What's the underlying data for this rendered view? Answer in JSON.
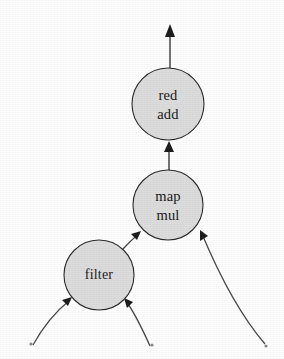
{
  "diagram": {
    "type": "dataflow-graph",
    "title": "",
    "background_color": "#fefefe",
    "node_fill_color": "#dcdcdc",
    "node_stroke_color": "#2b2b2b",
    "edge_color": "#3a3a3a",
    "nodes": [
      {
        "id": "red-add",
        "lines": [
          "red",
          "add"
        ],
        "line1": "red",
        "line2": "add",
        "cx": 168,
        "cy": 104,
        "r": 36
      },
      {
        "id": "map-mul",
        "lines": [
          "map",
          "mul"
        ],
        "line1": "map",
        "line2": "mul",
        "cx": 168,
        "cy": 205,
        "r": 35
      },
      {
        "id": "filter",
        "lines": [
          "filter"
        ],
        "line1": "filter",
        "line2": "",
        "cx": 99,
        "cy": 275,
        "r": 35
      }
    ],
    "edges": [
      {
        "id": "edge-map-to-red",
        "from": "map-mul",
        "to": "red-add",
        "style": "straight"
      },
      {
        "id": "edge-red-to-output",
        "from": "red-add",
        "to": "output",
        "style": "straight"
      },
      {
        "id": "edge-filter-to-map",
        "from": "filter",
        "to": "map-mul",
        "style": "straight"
      },
      {
        "id": "edge-source-right-to-map",
        "from": "source-right",
        "to": "map-mul",
        "style": "curved"
      },
      {
        "id": "edge-source-left-to-filter",
        "from": "source-left",
        "to": "filter",
        "style": "curved"
      },
      {
        "id": "edge-source-mid-to-filter",
        "from": "source-mid",
        "to": "filter",
        "style": "curved"
      }
    ],
    "sources": [
      {
        "id": "source-left",
        "x": 31,
        "y": 344
      },
      {
        "id": "source-mid",
        "x": 152,
        "y": 345
      },
      {
        "id": "source-right",
        "x": 266,
        "y": 346
      }
    ],
    "output": {
      "id": "output-arrow",
      "x": 170,
      "y": 24
    }
  }
}
